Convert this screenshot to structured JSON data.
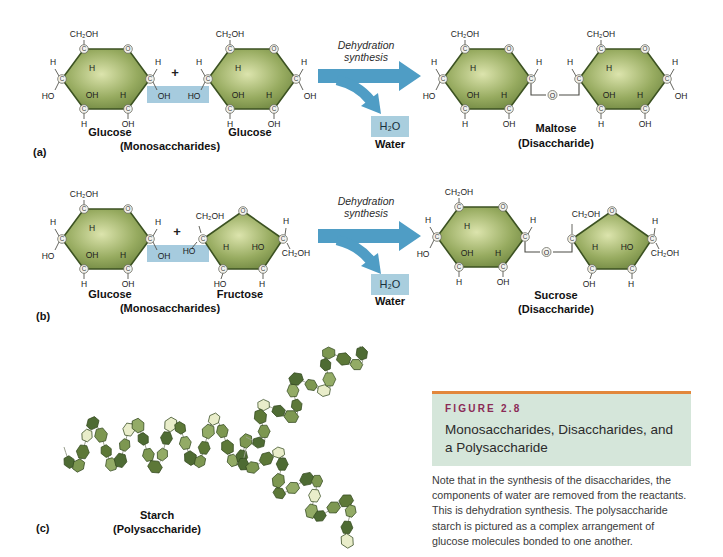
{
  "panel_labels": {
    "a": "(a)",
    "b": "(b)",
    "c": "(c)"
  },
  "atoms": {
    "c": "C",
    "o": "O",
    "h": "H",
    "oh": "OH",
    "ho": "HO",
    "ch2oh": "CH₂OH"
  },
  "operators": {
    "plus": "+"
  },
  "molecule_labels": {
    "glucose": "Glucose",
    "fructose": "Fructose",
    "monosaccharides": "(Monosaccharides)",
    "maltose": "Maltose",
    "sucrose": "Sucrose",
    "disaccharide": "(Disaccharide)",
    "starch": "Starch",
    "polysaccharide": "(Polysaccharide)"
  },
  "reaction": {
    "process_line1": "Dehydration",
    "process_line2": "synthesis",
    "water_formula": "H₂O",
    "water_label": "Water"
  },
  "figure_box": {
    "number": "FIGURE 2.8",
    "title": "Monosaccharides, Disaccharides, and a Polysaccharide",
    "caption": "Note that in the synthesis of the disaccharides, the components of water are removed from the reactants. This is dehydration synthesis. The polysaccharide starch is pictured as a complex arrangement of glucose molecules bonded to one another."
  },
  "colors": {
    "molecule_center": "#dce4ad",
    "molecule_edge": "#57702e",
    "molecule_stroke": "#3c5222",
    "highlight_blue": "#a6cbde",
    "arrow_blue": "#4f9dc5",
    "water_box_blue": "#a9cede",
    "figure_rule_orange": "#e2873b",
    "figure_header_green": "#d5e6da",
    "figure_number_maroon": "#8b2a56",
    "starch_palette": [
      "#4e6b33",
      "#7d9751",
      "#5d7838",
      "#93ab66",
      "#e9edca"
    ]
  }
}
